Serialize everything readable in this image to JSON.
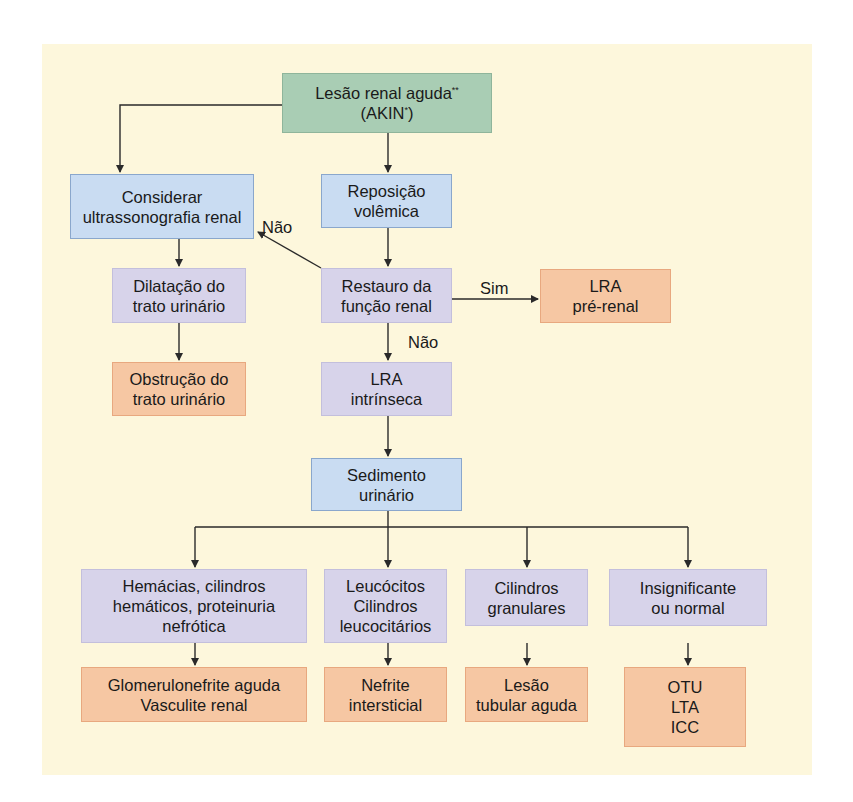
{
  "diagram": {
    "type": "flowchart",
    "nodes": {
      "start": {
        "label": "Lesão renal aguda",
        "sup": "**",
        "label2": "(AKIN",
        "sup2": "*",
        "label2_end": ")"
      },
      "ultrassom": {
        "label": "Considerar\nultrassonografia renal"
      },
      "reposicao": {
        "label": "Reposição\nvolêmica"
      },
      "dilatacao": {
        "label": "Dilatação do\ntrato urinário"
      },
      "restauro": {
        "label": "Restauro da\nfunção renal"
      },
      "pre_renal": {
        "label": "LRA\npré-renal"
      },
      "obstrucao": {
        "label": "Obstrução do\ntrato urinário"
      },
      "intrinseca": {
        "label": "LRA\nintrínseca"
      },
      "sedimento": {
        "label": "Sedimento\nurinário"
      },
      "hemacias": {
        "label": "Hemácias, cilindros\nhemáticos, proteinuria\nnefrótica"
      },
      "leucocitos": {
        "label": "Leucócitos\nCilindros\nleucocitários"
      },
      "granulares": {
        "label": "Cilindros\ngranulares"
      },
      "insignificante": {
        "label": "Insignificante\nou normal"
      },
      "glomerulo": {
        "label": "Glomerulonefrite aguda\nVasculite renal"
      },
      "nefrite": {
        "label": "Nefrite\nintersticial"
      },
      "tubular": {
        "label": "Lesão\ntubular aguda"
      },
      "otu": {
        "label": "OTU\nLTA\nICC"
      }
    },
    "edge_labels": {
      "nao_left": "Não",
      "sim": "Sim",
      "nao_down": "Não"
    },
    "colors": {
      "background": "#fdf7dc",
      "start": "#a9cdb4",
      "action": "#c9dcf2",
      "finding": "#d7d3ea",
      "diagnosis": "#f6c7a3",
      "line": "#2a2a2a"
    }
  }
}
